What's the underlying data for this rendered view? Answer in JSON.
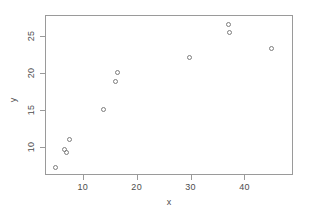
{
  "chart_data": {
    "type": "scatter",
    "title": "",
    "xlabel": "x",
    "ylabel": "y",
    "xlim": [
      3.0,
      49.0
    ],
    "ylim": [
      6.2,
      27.8
    ],
    "grid": false,
    "legend": null,
    "xticks": [
      10,
      20,
      30,
      40
    ],
    "yticks": [
      10,
      15,
      20,
      25
    ],
    "xtick_labels": [
      "10",
      "20",
      "30",
      "40"
    ],
    "ytick_labels": [
      "10",
      "15",
      "20",
      "25"
    ],
    "marker": "open-circle",
    "marker_color": "#7d7d7d",
    "frame_color": "#9a9a9a",
    "background": "#ffffff",
    "points": [
      {
        "x": 5.0,
        "y": 7.2
      },
      {
        "x": 6.7,
        "y": 9.6
      },
      {
        "x": 7.0,
        "y": 9.3
      },
      {
        "x": 7.6,
        "y": 11.0
      },
      {
        "x": 13.8,
        "y": 15.1
      },
      {
        "x": 16.0,
        "y": 18.8
      },
      {
        "x": 16.5,
        "y": 20.0
      },
      {
        "x": 29.8,
        "y": 22.0
      },
      {
        "x": 37.0,
        "y": 26.5
      },
      {
        "x": 37.2,
        "y": 25.4
      },
      {
        "x": 45.0,
        "y": 23.3
      }
    ]
  }
}
